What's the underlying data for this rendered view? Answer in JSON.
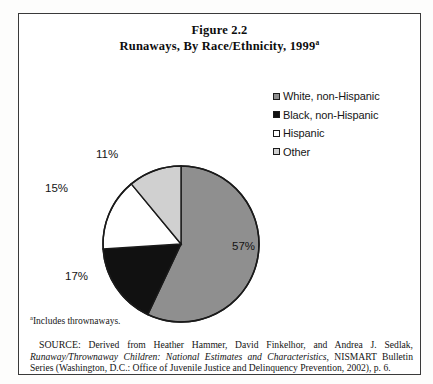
{
  "figure": {
    "title_line1": "Figure 2.2",
    "title_line2": "Runaways, By Race/Ethnicity, 1999",
    "title_superscript": "a"
  },
  "legend": {
    "items": [
      {
        "label": "White, non-Hispanic",
        "color": "#8f8f8f"
      },
      {
        "label": "Black, non-Hispanic",
        "color": "#111111"
      },
      {
        "label": "Hispanic",
        "color": "#ffffff"
      },
      {
        "label": "Other",
        "color": "#d0d0d0"
      }
    ]
  },
  "labels": {
    "white": "57%",
    "black": "17%",
    "hispanic": "15%",
    "other": "11%"
  },
  "footnote": {
    "marker": "a",
    "text": "Includes thrownaways."
  },
  "source": {
    "prefix": "SOURCE:",
    "text_part1": " Derived from Heather Hammer, David Finkelhor, and Andrea J. Sedlak, ",
    "italic_title": "Runaway/Thrownaway Children: National Estimates and Characteristics,",
    "text_part2": " NISMART Bulletin Series (Washington, D.C.: Office of Juvenile Justice and Delinquency Prevention, 2002), p. 6."
  },
  "chart_data": {
    "type": "pie",
    "categories": [
      "White, non-Hispanic",
      "Black, non-Hispanic",
      "Hispanic",
      "Other"
    ],
    "values": [
      57,
      17,
      15,
      11
    ],
    "unit": "percent",
    "data_labels": [
      "57%",
      "17%",
      "15%",
      "11%"
    ],
    "colors": [
      "#8f8f8f",
      "#111111",
      "#ffffff",
      "#d0d0d0"
    ],
    "start_angle_deg": 0,
    "direction": "clockwise",
    "legend_position": "top-right",
    "grid": false
  }
}
